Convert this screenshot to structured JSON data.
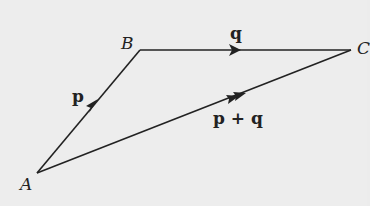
{
  "diagram": {
    "type": "vector-triangle",
    "points": {
      "A": {
        "label": "A",
        "x": 37,
        "y": 173
      },
      "B": {
        "label": "B",
        "x": 140,
        "y": 50
      },
      "C": {
        "label": "C",
        "x": 351,
        "y": 50
      }
    },
    "vectors": [
      {
        "from": "A",
        "to": "B",
        "label": "p",
        "arrows": 1
      },
      {
        "from": "B",
        "to": "C",
        "label": "q",
        "arrows": 1
      },
      {
        "from": "A",
        "to": "C",
        "label": "p + q",
        "arrows": 2
      }
    ],
    "colors": {
      "line": "#222222",
      "background": "#ededed"
    }
  }
}
